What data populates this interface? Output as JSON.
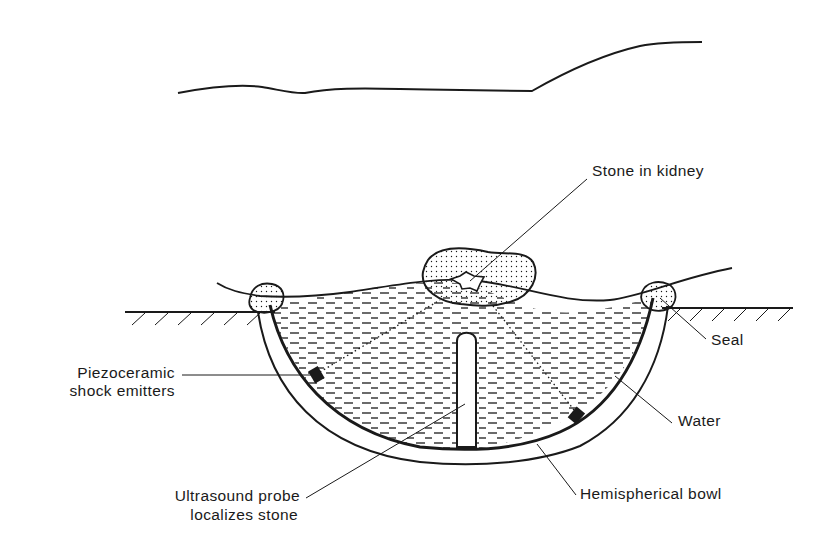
{
  "figure": {
    "labels": {
      "stone_in_kidney": "Stone in kidney",
      "seal": "Seal",
      "water": "Water",
      "hemispherical_bowl": "Hemispherical bowl",
      "piezo_line1": "Piezoceramic",
      "piezo_line2": "shock emitters",
      "probe_line1": "Ultrasound probe",
      "probe_line2": "localizes stone"
    },
    "colors": {
      "ink": "#1a1a1a",
      "paper": "#ffffff"
    }
  }
}
